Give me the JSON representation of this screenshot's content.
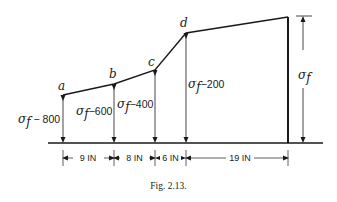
{
  "figure": {
    "caption": "Fig. 2.13.",
    "points": [
      {
        "id": "a",
        "label": "a",
        "x": 63,
        "y": 95,
        "stress_label_sym": "σ",
        "stress_label_sub": "f",
        "stress_label_rest": " − 800"
      },
      {
        "id": "b",
        "label": "b",
        "x": 114,
        "y": 84,
        "stress_label_sym": "σ",
        "stress_label_sub": "f",
        "stress_label_rest": "−600"
      },
      {
        "id": "c",
        "label": "c",
        "x": 155,
        "y": 70,
        "stress_label_sym": "σ",
        "stress_label_sub": "f",
        "stress_label_rest": "−400"
      },
      {
        "id": "d",
        "label": "d",
        "x": 186,
        "y": 33,
        "stress_label_sym": "σ",
        "stress_label_sub": "f",
        "stress_label_rest": "−200"
      }
    ],
    "end_label": {
      "sym": "σ",
      "sub": "f"
    },
    "dimensions": [
      {
        "label": "9 IN",
        "value": 9,
        "unit": "IN"
      },
      {
        "label": "8 IN",
        "value": 8,
        "unit": "IN"
      },
      {
        "label": "6 IN",
        "value": 6,
        "unit": "IN"
      },
      {
        "label": "19 IN",
        "value": 19,
        "unit": "IN"
      }
    ],
    "colors": {
      "line": "#1a1a1a",
      "background": "#ffffff"
    }
  }
}
